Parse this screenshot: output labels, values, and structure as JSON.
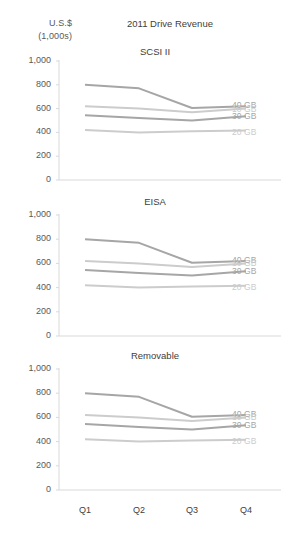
{
  "figure": {
    "title": "2011 Drive Revenue",
    "axis_unit_line1": "U.S.$",
    "axis_unit_line2": "(1,000s)"
  },
  "chart_data": {
    "type": "line",
    "title": "2011 Drive Revenue",
    "xlabel": "",
    "ylabel": "U.S.$ (1,000s)",
    "ylim": [
      0,
      1000
    ],
    "yticks": [
      0,
      200,
      400,
      600,
      800,
      1000
    ],
    "ytick_labels": [
      "0",
      "200",
      "400",
      "600",
      "800",
      "1,000"
    ],
    "categories": [
      "Q1",
      "Q2",
      "Q3",
      "Q4"
    ],
    "grid": false,
    "legend_position": "right",
    "panel_layout": "vertical-small-multiples",
    "panels": [
      {
        "title": "SCSI II",
        "series": [
          {
            "name": "40 GB",
            "values": [
              800,
              770,
              605,
              620
            ],
            "color": "#a6a6a6"
          },
          {
            "name": "10 GB",
            "values": [
              620,
              600,
              570,
              600
            ],
            "color": "#cccccc"
          },
          {
            "name": "30 GB",
            "values": [
              545,
              520,
              500,
              535
            ],
            "color": "#a6a6a6"
          },
          {
            "name": "20 GB",
            "values": [
              420,
              400,
              410,
              415
            ],
            "color": "#cccccc"
          }
        ]
      },
      {
        "title": "EISA",
        "series": [
          {
            "name": "40 GB",
            "values": [
              800,
              770,
              605,
              620
            ],
            "color": "#a6a6a6"
          },
          {
            "name": "10 GB",
            "values": [
              620,
              600,
              570,
              600
            ],
            "color": "#cccccc"
          },
          {
            "name": "30 GB",
            "values": [
              545,
              520,
              500,
              535
            ],
            "color": "#a6a6a6"
          },
          {
            "name": "20 GB",
            "values": [
              420,
              400,
              410,
              415
            ],
            "color": "#cccccc"
          }
        ]
      },
      {
        "title": "Removable",
        "series": [
          {
            "name": "40 GB",
            "values": [
              800,
              770,
              605,
              620
            ],
            "color": "#a6a6a6"
          },
          {
            "name": "10 GB",
            "values": [
              620,
              600,
              570,
              600
            ],
            "color": "#cccccc"
          },
          {
            "name": "30 GB",
            "values": [
              545,
              520,
              500,
              535
            ],
            "color": "#a6a6a6"
          },
          {
            "name": "20 GB",
            "values": [
              420,
              400,
              410,
              415
            ],
            "color": "#cccccc"
          }
        ]
      }
    ],
    "legend_entries": [
      {
        "label": "40 GB",
        "color": "#a6a6a6"
      },
      {
        "label": "10 GB",
        "color": "#cccccc"
      },
      {
        "label": "30 GB",
        "color": "#a6a6a6"
      },
      {
        "label": "20 GB",
        "color": "#cccccc"
      }
    ]
  },
  "colors": {
    "axis": "#d9d9d9",
    "tick_text": "#595959",
    "title_text": "#404040",
    "series_dark": "#a6a6a6",
    "series_light": "#cccccc",
    "background": "#ffffff"
  }
}
